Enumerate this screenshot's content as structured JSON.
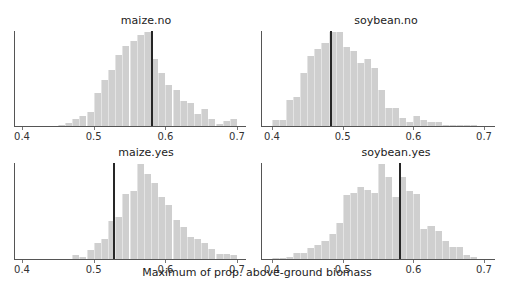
{
  "chart_data": [
    {
      "type": "bar",
      "title": "maize.no",
      "xlabel": "",
      "ylabel": "",
      "xlim": [
        0.385,
        0.72
      ],
      "x_ticks": [
        0.4,
        0.5,
        0.6,
        0.7
      ],
      "x_tick_labels": [
        "0.4",
        "0.5",
        "0.6",
        "0.7"
      ],
      "bin_width": 0.01,
      "bins_start": [
        0.45,
        0.46,
        0.47,
        0.48,
        0.49,
        0.5,
        0.51,
        0.52,
        0.53,
        0.54,
        0.55,
        0.56,
        0.57,
        0.58,
        0.59,
        0.6,
        0.61,
        0.62,
        0.63,
        0.64,
        0.65,
        0.66,
        0.67,
        0.68,
        0.69
      ],
      "values": [
        1,
        3,
        7,
        10,
        15,
        34,
        48,
        58,
        74,
        83,
        89,
        95,
        98,
        70,
        55,
        43,
        38,
        26,
        24,
        12,
        18,
        7,
        2,
        5,
        7
      ],
      "reference_line": 0.581,
      "grid": false
    },
    {
      "type": "bar",
      "title": "soybean.no",
      "xlabel": "",
      "ylabel": "",
      "xlim": [
        0.385,
        0.72
      ],
      "x_ticks": [
        0.4,
        0.5,
        0.6,
        0.7
      ],
      "x_tick_labels": [
        "0.4",
        "0.5",
        "0.6",
        "0.7"
      ],
      "bin_width": 0.01,
      "bins_start": [
        0.4,
        0.41,
        0.42,
        0.43,
        0.44,
        0.45,
        0.46,
        0.47,
        0.48,
        0.49,
        0.5,
        0.51,
        0.52,
        0.53,
        0.54,
        0.55,
        0.56,
        0.57,
        0.58,
        0.59,
        0.6,
        0.61,
        0.62,
        0.63,
        0.64,
        0.65,
        0.66,
        0.67,
        0.68
      ],
      "values": [
        6,
        6,
        28,
        31,
        56,
        75,
        82,
        88,
        100,
        100,
        84,
        80,
        67,
        71,
        62,
        38,
        19,
        19,
        9,
        4,
        11,
        6,
        4,
        4,
        1,
        1,
        0.5,
        0.5,
        0.3
      ],
      "reference_line": 0.483,
      "grid": false
    },
    {
      "type": "bar",
      "title": "maize.yes",
      "xlabel": "",
      "ylabel": "",
      "xlim": [
        0.385,
        0.72
      ],
      "x_ticks": [
        0.4,
        0.5,
        0.6,
        0.7
      ],
      "x_tick_labels": [
        "0.4",
        "0.5",
        "0.6",
        "0.7"
      ],
      "bin_width": 0.01,
      "bins_start": [
        0.47,
        0.48,
        0.49,
        0.5,
        0.51,
        0.52,
        0.53,
        0.54,
        0.55,
        0.56,
        0.57,
        0.58,
        0.59,
        0.6,
        0.61,
        0.62,
        0.63,
        0.64,
        0.65,
        0.66,
        0.67,
        0.68,
        0.69
      ],
      "values": [
        4,
        2,
        9,
        17,
        21,
        40,
        44,
        68,
        72,
        100,
        90,
        80,
        65,
        57,
        41,
        34,
        23,
        21,
        17,
        11,
        5,
        5,
        4
      ],
      "reference_line": 0.529,
      "grid": false
    },
    {
      "type": "bar",
      "title": "soybean.yes",
      "xlabel": "",
      "ylabel": "",
      "xlim": [
        0.385,
        0.72
      ],
      "x_ticks": [
        0.4,
        0.5,
        0.6,
        0.7
      ],
      "x_tick_labels": [
        "0.4",
        "0.5",
        "0.6",
        "0.7"
      ],
      "bin_width": 0.01,
      "bins_start": [
        0.4,
        0.41,
        0.42,
        0.43,
        0.44,
        0.45,
        0.46,
        0.47,
        0.48,
        0.49,
        0.5,
        0.51,
        0.52,
        0.53,
        0.54,
        0.55,
        0.56,
        0.57,
        0.58,
        0.59,
        0.6,
        0.61,
        0.62,
        0.63,
        0.64,
        0.65,
        0.66,
        0.67,
        0.68
      ],
      "values": [
        1,
        0.5,
        2,
        6,
        6,
        12,
        15,
        19,
        26,
        38,
        67,
        70,
        76,
        73,
        70,
        100,
        86,
        65,
        86,
        72,
        68,
        32,
        35,
        29,
        19,
        13,
        13,
        4,
        2
      ],
      "reference_line": 0.581,
      "grid": false
    }
  ],
  "figure": {
    "shared_xlabel": "Maximum of prop. above-ground biomass"
  }
}
